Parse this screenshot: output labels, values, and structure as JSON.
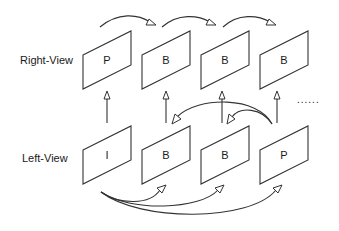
{
  "diagram": {
    "type": "stereo-video-prediction-structure",
    "rows": {
      "right_view": {
        "label": "Right-View",
        "frames": [
          "P",
          "B",
          "B",
          "B"
        ]
      },
      "left_view": {
        "label": "Left-View",
        "frames": [
          "I",
          "B",
          "B",
          "P"
        ]
      }
    },
    "continuation": "......",
    "edges": [
      {
        "from": "right_view.0",
        "to": "right_view.1",
        "kind": "temporal-curve"
      },
      {
        "from": "right_view.1",
        "to": "right_view.2",
        "kind": "temporal-curve"
      },
      {
        "from": "right_view.2",
        "to": "right_view.3",
        "kind": "temporal-curve"
      },
      {
        "from": "left_view.0",
        "to": "right_view.0",
        "kind": "inter-view"
      },
      {
        "from": "left_view.1",
        "to": "right_view.1",
        "kind": "inter-view"
      },
      {
        "from": "left_view.2",
        "to": "right_view.2",
        "kind": "inter-view"
      },
      {
        "from": "left_view.3",
        "to": "right_view.3",
        "kind": "inter-view"
      },
      {
        "from": "left_view.3",
        "to": "left_view.1",
        "kind": "backward-curve"
      },
      {
        "from": "left_view.3",
        "to": "left_view.2",
        "kind": "backward-curve"
      },
      {
        "from": "left_view.0",
        "to": "left_view.1",
        "kind": "forward-curve"
      },
      {
        "from": "left_view.0",
        "to": "left_view.2",
        "kind": "forward-curve"
      },
      {
        "from": "left_view.0",
        "to": "left_view.3",
        "kind": "forward-curve"
      }
    ]
  }
}
